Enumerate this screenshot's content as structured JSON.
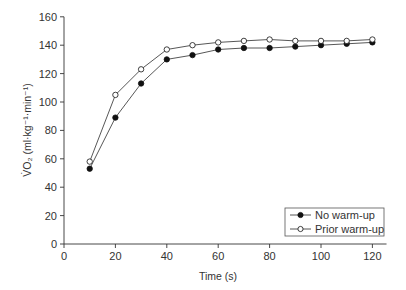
{
  "chart_data": {
    "type": "line",
    "title": "",
    "xlabel": "Time (s)",
    "ylabel": "V̇O₂ (ml·kg⁻¹·min⁻¹)",
    "xlim": [
      0,
      125
    ],
    "ylim": [
      0,
      160
    ],
    "xticks": [
      0,
      20,
      40,
      60,
      80,
      100,
      120
    ],
    "yticks": [
      0,
      20,
      40,
      60,
      80,
      100,
      120,
      140,
      160
    ],
    "grid": false,
    "legend_position": "lower right",
    "x": [
      10,
      20,
      30,
      40,
      50,
      60,
      70,
      80,
      90,
      100,
      110,
      120
    ],
    "series": [
      {
        "name": "No warm-up",
        "marker": "filled-circle",
        "values": [
          53,
          89,
          113,
          130,
          133,
          137,
          138,
          138,
          139,
          140,
          141,
          142
        ]
      },
      {
        "name": "Prior warm-up",
        "marker": "open-circle",
        "values": [
          58,
          105,
          123,
          137,
          140,
          142,
          143,
          144,
          143,
          143,
          143,
          144
        ]
      }
    ]
  },
  "colors": {
    "axis": "#333333",
    "line": "#444444",
    "filled_marker": "#111111",
    "open_marker_fill": "#ffffff"
  }
}
